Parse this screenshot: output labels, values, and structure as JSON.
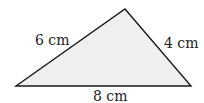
{
  "diagram": {
    "shape": "triangle",
    "fill": "#efefef",
    "stroke": "#1a1a1a",
    "vertices": [
      [
        16,
        86
      ],
      [
        125,
        9
      ],
      [
        191,
        86
      ]
    ],
    "labels": {
      "left_side": "6 cm",
      "right_side": "4 cm",
      "base": "8 cm"
    }
  }
}
